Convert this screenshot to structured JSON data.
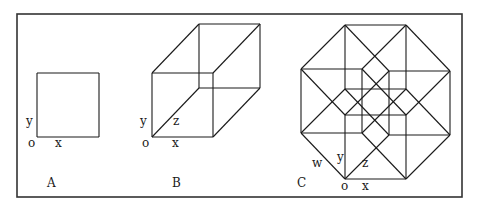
{
  "frame": {
    "x": 17,
    "y": 14,
    "width": 445,
    "height": 183,
    "stroke": "#333333",
    "stroke_width": 1.6
  },
  "line_color": "#1a1a1a",
  "figures": [
    {
      "id": "A",
      "caption": {
        "text": "A",
        "x": 47,
        "y": 187
      },
      "description": "square (2D)",
      "origin": [
        37,
        137
      ],
      "axes": {
        "x": [
          62,
          0
        ],
        "y": [
          0,
          -64
        ]
      },
      "labels": [
        {
          "text": "y",
          "x": 26,
          "y": 125
        },
        {
          "text": "o",
          "x": 28,
          "y": 147
        },
        {
          "text": "x",
          "x": 55,
          "y": 147
        }
      ]
    },
    {
      "id": "B",
      "caption": {
        "text": "B",
        "x": 172,
        "y": 187
      },
      "description": "cube (3D)",
      "origin": [
        152,
        137
      ],
      "axes": {
        "x": [
          61,
          0
        ],
        "y": [
          0,
          -64
        ],
        "z": [
          47,
          -49
        ]
      },
      "labels": [
        {
          "text": "y",
          "x": 140,
          "y": 125
        },
        {
          "text": "z",
          "x": 173,
          "y": 125
        },
        {
          "text": "o",
          "x": 142,
          "y": 147
        },
        {
          "text": "x",
          "x": 172,
          "y": 147
        }
      ]
    },
    {
      "id": "C",
      "caption": {
        "text": "C",
        "x": 297,
        "y": 187
      },
      "description": "tesseract / hypercube (4D)",
      "origin": [
        345,
        179
      ],
      "axes": {
        "x": [
          61,
          0
        ],
        "y": [
          0,
          -64
        ],
        "z": [
          44,
          -44
        ],
        "w": [
          -44,
          -46
        ]
      },
      "labels": [
        {
          "text": "w",
          "x": 312,
          "y": 167
        },
        {
          "text": "y",
          "x": 337,
          "y": 161
        },
        {
          "text": "z",
          "x": 362,
          "y": 167
        },
        {
          "text": "o",
          "x": 341,
          "y": 190
        },
        {
          "text": "x",
          "x": 362,
          "y": 190
        }
      ]
    }
  ]
}
